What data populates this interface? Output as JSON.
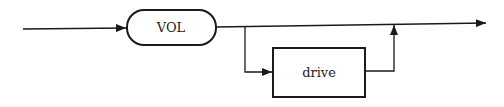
{
  "diagram": {
    "type": "syntax-diagram",
    "keyword": {
      "label": "VOL",
      "shape": "rounded"
    },
    "optional": {
      "label": "drive",
      "shape": "rectangle"
    },
    "line_color": "#1a1a1a"
  }
}
